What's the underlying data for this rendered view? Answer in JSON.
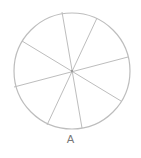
{
  "diagram": {
    "label": "A",
    "stroke_color": "#bdbdbd",
    "circle": {
      "cx": 72,
      "cy": 71,
      "r": 58
    },
    "spokes": [
      {
        "x1": 62,
        "y1": 12,
        "x2": 82,
        "y2": 128
      },
      {
        "x1": 97,
        "y1": 18,
        "x2": 47,
        "y2": 125
      },
      {
        "x1": 22,
        "y1": 41,
        "x2": 121,
        "y2": 101
      },
      {
        "x1": 128,
        "y1": 57,
        "x2": 14,
        "y2": 87
      }
    ],
    "sector_count": 8
  }
}
